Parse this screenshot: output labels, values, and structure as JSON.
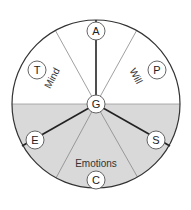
{
  "diagram": {
    "title": "",
    "colors": {
      "background": "#ffffff",
      "shade": "#d9d9d9",
      "outline": "#333333",
      "thin_line": "#888888",
      "thick_line": "#222222",
      "node_fill": "#ffffff"
    },
    "center": {
      "id": "G",
      "label": "G"
    },
    "nodes": [
      {
        "id": "A",
        "label": "A"
      },
      {
        "id": "T",
        "label": "T"
      },
      {
        "id": "P",
        "label": "P"
      },
      {
        "id": "E",
        "label": "E"
      },
      {
        "id": "S",
        "label": "S"
      },
      {
        "id": "C",
        "label": "C"
      }
    ],
    "sectors": [
      {
        "id": "mind",
        "label": "Mind"
      },
      {
        "id": "will",
        "label": "Will"
      },
      {
        "id": "emotions",
        "label": "Emotions"
      }
    ],
    "connections": [
      {
        "from": "G",
        "to": "A",
        "style": "thick"
      },
      {
        "from": "G",
        "to": "E",
        "style": "thick"
      },
      {
        "from": "G",
        "to": "S",
        "style": "thick"
      }
    ]
  }
}
